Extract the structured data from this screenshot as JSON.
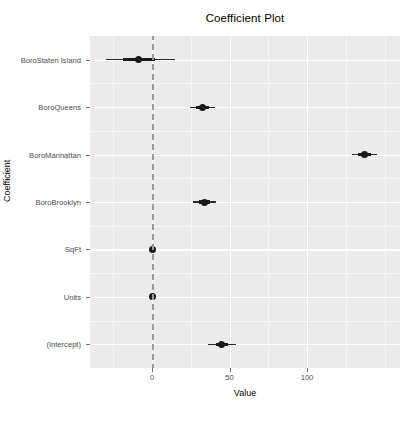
{
  "chart_data": {
    "type": "scatter",
    "title": "Coefficient Plot",
    "xlabel": "Value",
    "ylabel": "Coefficient",
    "xlim": [
      -40,
      160
    ],
    "x_ticks": [
      0,
      50,
      100
    ],
    "x_tick_labels": [
      "0",
      "50",
      "100"
    ],
    "grid": true,
    "legend": "none",
    "reference_line": {
      "orientation": "vertical",
      "value": 0,
      "style": "dashed",
      "color": "#9a9a9a"
    },
    "categories": [
      "BoroStaten Island",
      "BoroQueens",
      "BoroManhattan",
      "BoroBrooklyn",
      "SqFt",
      "Units",
      "(Intercept)"
    ],
    "points": [
      {
        "label": "BoroStaten Island",
        "estimate": -8.4,
        "inner_low": -19.0,
        "inner_high": 2.2,
        "outer_low": -30.0,
        "outer_high": 15.0
      },
      {
        "label": "BoroQueens",
        "estimate": 32.5,
        "inner_low": 28.5,
        "inner_high": 36.5,
        "outer_low": 24.5,
        "outer_high": 40.5
      },
      {
        "label": "BoroManhattan",
        "estimate": 137.0,
        "inner_low": 133.0,
        "inner_high": 141.0,
        "outer_low": 129.0,
        "outer_high": 145.0
      },
      {
        "label": "BoroBrooklyn",
        "estimate": 33.7,
        "inner_low": 30.0,
        "inner_high": 37.4,
        "outer_low": 26.3,
        "outer_high": 41.1
      },
      {
        "label": "SqFt",
        "estimate": 0.0,
        "inner_low": 0.0,
        "inner_high": 0.0,
        "outer_low": 0.0,
        "outer_high": 0.0
      },
      {
        "label": "Units",
        "estimate": 0.0,
        "inner_low": 0.0,
        "inner_high": 0.0,
        "outer_low": 0.0,
        "outer_high": 0.0
      },
      {
        "label": "(Intercept)",
        "estimate": 45.0,
        "inner_low": 41.0,
        "inner_high": 49.0,
        "outer_low": 36.0,
        "outer_high": 54.0
      }
    ],
    "colors": {
      "panel_background": "#ebebeb",
      "gridline": "#ffffff",
      "point": "#1a1a1a",
      "reference_line": "#9a9a9a",
      "axis_text": "#4d4d4d"
    }
  }
}
